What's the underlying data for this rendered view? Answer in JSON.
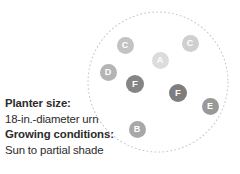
{
  "diagram": {
    "name": "container-planting-plan",
    "background_color": "#ffffff",
    "planter_outline": {
      "shape": "circle",
      "style": "dotted",
      "stroke_color": "#c9c9c9",
      "center_x": 158,
      "center_y": 82,
      "radius": 70
    },
    "markers": [
      {
        "label": "C",
        "x": 125,
        "y": 45,
        "size": 17,
        "color": "#c3c3c3",
        "font_size": 9
      },
      {
        "label": "C",
        "x": 190,
        "y": 43,
        "size": 17,
        "color": "#cfcfcf",
        "font_size": 9
      },
      {
        "label": "A",
        "x": 160,
        "y": 60,
        "size": 17,
        "color": "#dcdcdc",
        "font_size": 9
      },
      {
        "label": "D",
        "x": 108,
        "y": 72,
        "size": 17,
        "color": "#b4b4b4",
        "font_size": 9
      },
      {
        "label": "F",
        "x": 135,
        "y": 84,
        "size": 18,
        "color": "#858585",
        "font_size": 9.5
      },
      {
        "label": "F",
        "x": 178,
        "y": 93,
        "size": 18,
        "color": "#7e7e7e",
        "font_size": 9.5
      },
      {
        "label": "E",
        "x": 210,
        "y": 106,
        "size": 17,
        "color": "#999999",
        "font_size": 9
      },
      {
        "label": "B",
        "x": 137,
        "y": 129,
        "size": 17,
        "color": "#a8a8a8",
        "font_size": 9
      }
    ]
  },
  "caption": {
    "planter_size_heading": "Planter size:",
    "planter_size_value": "18-in.-diameter urn",
    "growing_conditions_heading": "Growing conditions:",
    "growing_conditions_value": "Sun to partial shade",
    "text_color": "#2b2b2b"
  }
}
